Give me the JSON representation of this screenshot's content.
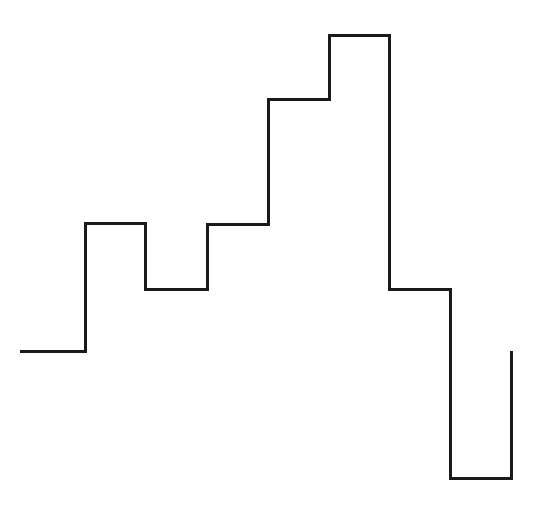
{
  "figure": {
    "background_color": "#ffffff",
    "width": 539,
    "height": 507,
    "title": "",
    "subtitle": "",
    "caption": ""
  },
  "chart_data": {
    "type": "line",
    "style": "step-post",
    "title": "",
    "subtitle": "",
    "xlabel": "",
    "ylabel": "",
    "grid": false,
    "legend": null,
    "legend_position": "none",
    "axes_visible": false,
    "tick_labels_x": [],
    "tick_labels_y": [],
    "annotations": [],
    "series": [
      {
        "name": "step-outline",
        "color": "#1a1a1a",
        "line_width": 3,
        "bin_edges_px": [
          20,
          85,
          145,
          207,
          268,
          329,
          389,
          450,
          511
        ],
        "top_y_px": [
          351,
          223,
          289,
          224,
          99,
          35,
          289,
          478
        ],
        "categories": [
          "1",
          "2",
          "3",
          "4",
          "5",
          "6",
          "7",
          "8"
        ],
        "values": [
          15,
          44,
          30,
          44,
          72,
          86,
          30,
          1
        ],
        "xlim": [
          20,
          511
        ],
        "ylim_px": [
          507,
          0
        ]
      }
    ],
    "path_points_px": [
      [
        20,
        351
      ],
      [
        85,
        351
      ],
      [
        85,
        223
      ],
      [
        145,
        223
      ],
      [
        145,
        289
      ],
      [
        207,
        289
      ],
      [
        207,
        224
      ],
      [
        268,
        224
      ],
      [
        268,
        99
      ],
      [
        329,
        99
      ],
      [
        329,
        35
      ],
      [
        389,
        35
      ],
      [
        389,
        289
      ],
      [
        450,
        289
      ],
      [
        450,
        478
      ],
      [
        511,
        478
      ],
      [
        511,
        351
      ]
    ]
  }
}
